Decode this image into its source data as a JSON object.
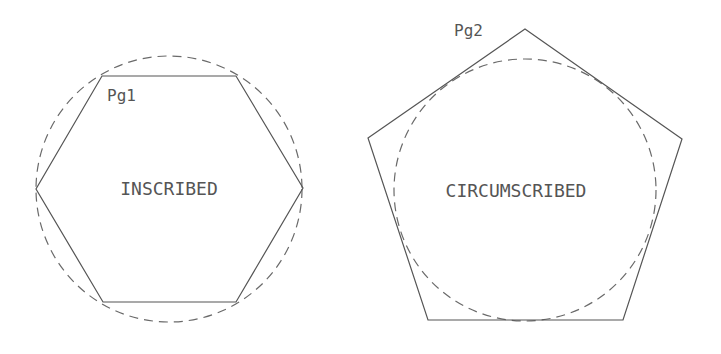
{
  "figures": [
    {
      "id": "pg1",
      "tag_label": "Pg1",
      "caption": "INSCRIBED",
      "polygon": "hexagon",
      "polygon_points": "102,76 236,76 303,188 236,302 103,302 36,189",
      "circle": {
        "cx": 169,
        "cy": 189,
        "r": 133,
        "style": "dashed"
      },
      "tag_pos": {
        "x": 107,
        "y": 101
      },
      "caption_pos": {
        "x": 169,
        "y": 190
      }
    },
    {
      "id": "pg2",
      "tag_label": "Pg2",
      "caption": "CIRCUMSCRIBED",
      "polygon": "pentagon",
      "polygon_points": "525,29 682,139 623,320 428,320 368,138",
      "circle": {
        "cx": 525,
        "cy": 190,
        "r": 131,
        "style": "dashed"
      },
      "tag_pos": {
        "x": 454,
        "y": 36
      },
      "caption_pos": {
        "x": 516,
        "y": 192
      }
    }
  ],
  "colors": {
    "line": "#555555",
    "dash": "#6a6a6a",
    "text": "#555555",
    "background": "#ffffff"
  }
}
